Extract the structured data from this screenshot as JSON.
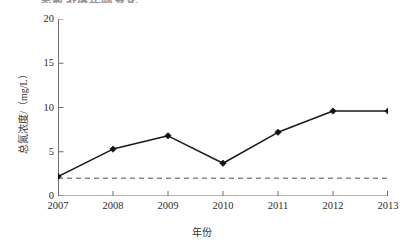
{
  "figure": {
    "title_remnant": "总氮浓度年际变化",
    "background_color": "#ffffff"
  },
  "chart_data": {
    "type": "line",
    "title": "",
    "xlabel": "年份",
    "ylabel": "总氮浓度/（mg/L）",
    "categories": [
      "2007",
      "2008",
      "2009",
      "2010",
      "2011",
      "2012",
      "2013"
    ],
    "values": [
      2.2,
      5.3,
      6.8,
      3.7,
      7.2,
      9.6,
      9.6
    ],
    "series": [
      {
        "name": "总氮浓度",
        "values": [
          2.2,
          5.3,
          6.8,
          3.7,
          7.2,
          9.6,
          9.6
        ],
        "marker": "diamond",
        "color": "#1a1a1a",
        "line_style": "solid"
      }
    ],
    "reference_lines": [
      {
        "name": "标准限值",
        "orientation": "horizontal",
        "value": 2.0,
        "color": "#8a8a8a",
        "line_style": "dashed"
      }
    ],
    "ylim": [
      0,
      20
    ],
    "yticks": [
      0,
      5,
      10,
      15,
      20
    ],
    "ytick_labels": [
      "0",
      "5",
      "10",
      "15",
      "20"
    ],
    "xtick_labels": [
      "2007",
      "2008",
      "2009",
      "2010",
      "2011",
      "2012",
      "2013"
    ],
    "grid": false,
    "legend": null,
    "legend_position": "none",
    "axis_color": "#6e6e6e",
    "marker_color": "#111111"
  }
}
